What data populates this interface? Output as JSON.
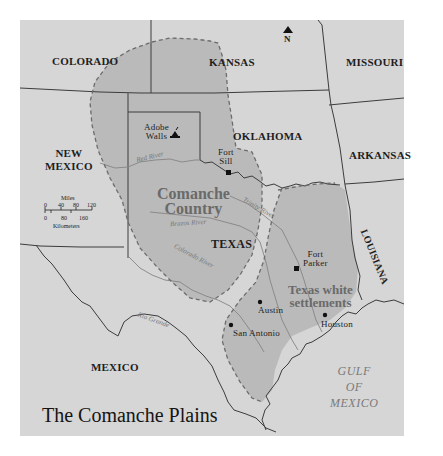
{
  "title": "The Comanche Plains",
  "colors": {
    "background": "#ffffff",
    "land": "#d6d6d6",
    "comanche_area": "#b9b9b9",
    "border": "#3c3c3c",
    "river": "#7e7e7e",
    "dashed_boundary": "#6c6c6c",
    "region_label": "#6a6a6a"
  },
  "states": [
    {
      "name": "COLORADO"
    },
    {
      "name": "KANSAS"
    },
    {
      "name": "MISSOURI"
    },
    {
      "name": "OKLAHOMA"
    },
    {
      "name": "ARKANSAS"
    },
    {
      "name": "NEW MEXICO",
      "lines": [
        "NEW",
        "MEXICO"
      ]
    },
    {
      "name": "TEXAS"
    },
    {
      "name": "LOUISIANA"
    },
    {
      "name": "MEXICO"
    }
  ],
  "regions": {
    "comanche_country": {
      "line1": "Comanche",
      "line2": "Country"
    },
    "texas_white": {
      "line1": "Texas white",
      "line2": "settlements"
    }
  },
  "places": {
    "adobe_walls": {
      "line1": "Adobe",
      "line2": "Walls",
      "icon": "battle-site-icon"
    },
    "fort_sill": {
      "line1": "Fort",
      "line2": "Sill",
      "icon": "fort-square-icon"
    },
    "fort_parker": {
      "line1": "Fort",
      "line2": "Parker",
      "icon": "fort-square-icon"
    },
    "austin": {
      "label": "Austin",
      "icon": "city-dot-icon"
    },
    "san_antonio": {
      "label": "San Antonio",
      "icon": "city-dot-icon"
    },
    "houston": {
      "label": "Houston",
      "icon": "city-dot-icon"
    }
  },
  "rivers": {
    "red": "Red River",
    "trinity": "Trinity River",
    "brazos": "Brazos River",
    "colorado": "Colorado River",
    "rio_grande": "Rio Grande"
  },
  "water": {
    "line1": "GULF",
    "line2": "OF",
    "line3": "MEXICO"
  },
  "north_arrow": {
    "label": "N"
  },
  "scale_bar": {
    "miles_label": "Miles",
    "miles_ticks": [
      "0",
      "40",
      "80",
      "120"
    ],
    "km_ticks": [
      "0",
      "80",
      "160"
    ],
    "km_label": "Kilometers"
  }
}
